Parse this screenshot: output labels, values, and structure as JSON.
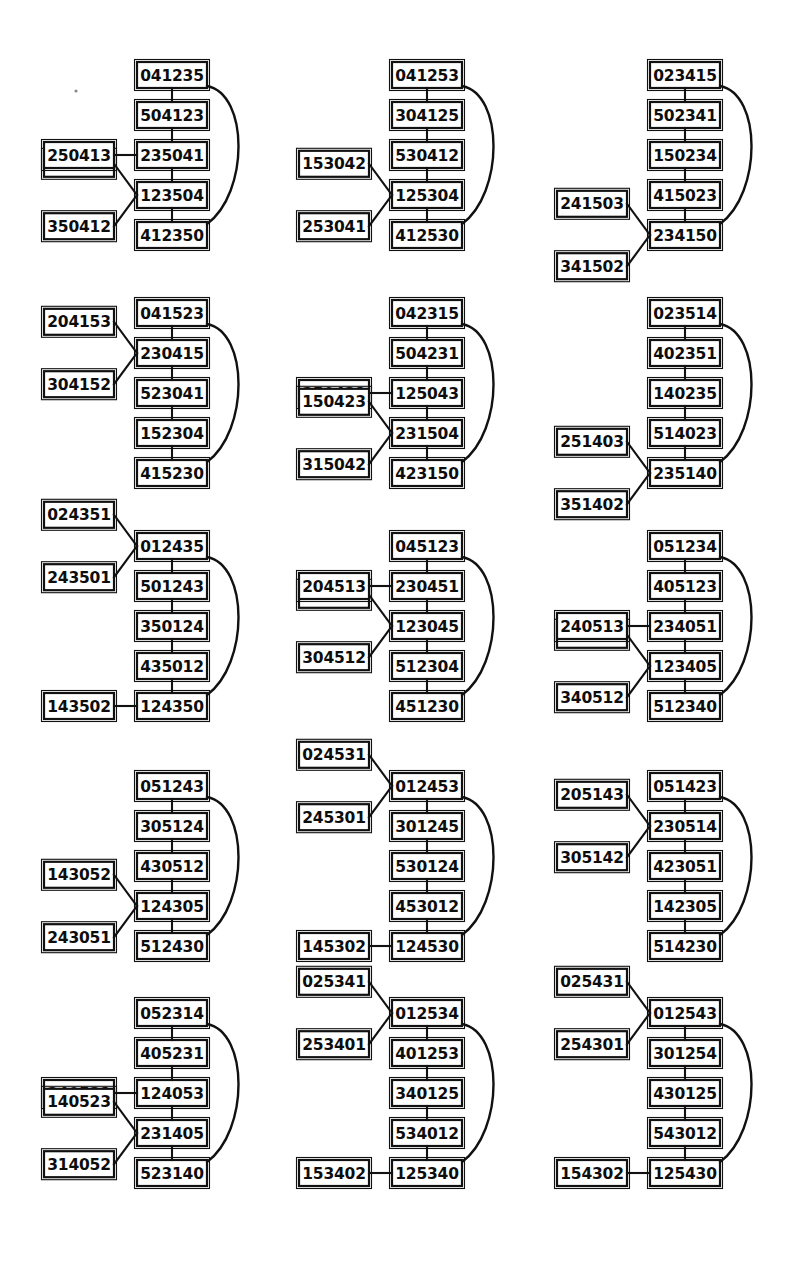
{
  "figure": {
    "type": "diagram-grid",
    "rows": 5,
    "columns": 3,
    "node_digit_count": 6,
    "colors": {
      "background": "#ffffff",
      "box_fill": "#ffffff",
      "stroke": "#111111",
      "text": "#0d0d0d"
    }
  },
  "diagrams": [
    {
      "id": "diagram-r1c1",
      "row": 1,
      "column": 1,
      "chain": [
        "041235",
        "504123",
        "235041",
        "123504",
        "412350"
      ],
      "arc": {
        "from": "041235",
        "to": "412350"
      },
      "side_nodes": [
        {
          "label": "250413",
          "attached_to": "235041"
        },
        {
          "label": "135042",
          "attached_to": "123504"
        },
        {
          "label": "350412",
          "attached_to": "123504"
        }
      ]
    },
    {
      "id": "diagram-r1c2",
      "row": 1,
      "column": 2,
      "chain": [
        "041253",
        "304125",
        "530412",
        "125304",
        "412530"
      ],
      "arc": {
        "from": "041253",
        "to": "412530"
      },
      "side_nodes": [
        {
          "label": "153042",
          "attached_to": "125304"
        },
        {
          "label": "253041",
          "attached_to": "125304"
        }
      ]
    },
    {
      "id": "diagram-r1c3",
      "row": 1,
      "column": 3,
      "chain": [
        "023415",
        "502341",
        "150234",
        "415023",
        "234150"
      ],
      "arc": {
        "from": "023415",
        "to": "234150"
      },
      "side_nodes": [
        {
          "label": "241503",
          "attached_to": "234150"
        },
        {
          "label": "341502",
          "attached_to": "234150"
        }
      ]
    },
    {
      "id": "diagram-r2c1",
      "row": 2,
      "column": 1,
      "chain": [
        "041523",
        "230415",
        "523041",
        "152304",
        "415230"
      ],
      "arc": {
        "from": "041523",
        "to": "415230"
      },
      "side_nodes": [
        {
          "label": "204153",
          "attached_to": "230415"
        },
        {
          "label": "304152",
          "attached_to": "230415"
        }
      ]
    },
    {
      "id": "diagram-r2c2",
      "row": 2,
      "column": 2,
      "chain": [
        "042315",
        "504231",
        "125043",
        "231504",
        "423150"
      ],
      "arc": {
        "from": "042315",
        "to": "423150"
      },
      "side_nodes": [
        {
          "label": "250431",
          "attached_to": "125043"
        },
        {
          "label": "150423",
          "attached_to": "231504"
        },
        {
          "label": "315042",
          "attached_to": "231504"
        }
      ]
    },
    {
      "id": "diagram-r2c3",
      "row": 2,
      "column": 3,
      "chain": [
        "023514",
        "402351",
        "140235",
        "514023",
        "235140"
      ],
      "arc": {
        "from": "023514",
        "to": "235140"
      },
      "side_nodes": [
        {
          "label": "251403",
          "attached_to": "235140"
        },
        {
          "label": "351402",
          "attached_to": "235140"
        }
      ]
    },
    {
      "id": "diagram-r3c1",
      "row": 3,
      "column": 1,
      "chain": [
        "012435",
        "501243",
        "350124",
        "435012",
        "124350"
      ],
      "arc": {
        "from": "012435",
        "to": "124350"
      },
      "side_nodes": [
        {
          "label": "024351",
          "attached_to": "012435"
        },
        {
          "label": "243501",
          "attached_to": "012435"
        },
        {
          "label": "143502",
          "attached_to": "124350"
        }
      ]
    },
    {
      "id": "diagram-r3c2",
      "row": 3,
      "column": 2,
      "chain": [
        "045123",
        "230451",
        "123045",
        "512304",
        "451230"
      ],
      "arc": {
        "from": "045123",
        "to": "451230"
      },
      "side_nodes": [
        {
          "label": "204513",
          "attached_to": "230451"
        },
        {
          "label": "130452",
          "attached_to": "123045"
        },
        {
          "label": "304512",
          "attached_to": "123045"
        }
      ]
    },
    {
      "id": "diagram-r3c3",
      "row": 3,
      "column": 3,
      "chain": [
        "051234",
        "405123",
        "234051",
        "123405",
        "512340"
      ],
      "arc": {
        "from": "051234",
        "to": "512340"
      },
      "side_nodes": [
        {
          "label": "240513",
          "attached_to": "234051"
        },
        {
          "label": "134052",
          "attached_to": "123405"
        },
        {
          "label": "340512",
          "attached_to": "123405"
        }
      ]
    },
    {
      "id": "diagram-r4c1",
      "row": 4,
      "column": 1,
      "chain": [
        "051243",
        "305124",
        "430512",
        "124305",
        "512430"
      ],
      "arc": {
        "from": "051243",
        "to": "512430"
      },
      "side_nodes": [
        {
          "label": "143052",
          "attached_to": "124305"
        },
        {
          "label": "243051",
          "attached_to": "124305"
        }
      ]
    },
    {
      "id": "diagram-r4c2",
      "row": 4,
      "column": 2,
      "chain": [
        "012453",
        "301245",
        "530124",
        "453012",
        "124530"
      ],
      "arc": {
        "from": "012453",
        "to": "124530"
      },
      "side_nodes": [
        {
          "label": "024531",
          "attached_to": "012453"
        },
        {
          "label": "245301",
          "attached_to": "012453"
        },
        {
          "label": "145302",
          "attached_to": "124530"
        }
      ]
    },
    {
      "id": "diagram-r4c3",
      "row": 4,
      "column": 3,
      "chain": [
        "051423",
        "230514",
        "423051",
        "142305",
        "514230"
      ],
      "arc": {
        "from": "051423",
        "to": "514230"
      },
      "side_nodes": [
        {
          "label": "205143",
          "attached_to": "230514"
        },
        {
          "label": "305142",
          "attached_to": "230514"
        }
      ]
    },
    {
      "id": "diagram-r5c1",
      "row": 5,
      "column": 1,
      "chain": [
        "052314",
        "405231",
        "124053",
        "231405",
        "523140"
      ],
      "arc": {
        "from": "052314",
        "to": "523140"
      },
      "side_nodes": [
        {
          "label": "240531",
          "attached_to": "124053"
        },
        {
          "label": "140523",
          "attached_to": "231405"
        },
        {
          "label": "314052",
          "attached_to": "231405"
        }
      ]
    },
    {
      "id": "diagram-r5c2",
      "row": 5,
      "column": 2,
      "chain": [
        "012534",
        "401253",
        "340125",
        "534012",
        "125340"
      ],
      "arc": {
        "from": "012534",
        "to": "125340"
      },
      "side_nodes": [
        {
          "label": "025341",
          "attached_to": "012534"
        },
        {
          "label": "253401",
          "attached_to": "012534"
        },
        {
          "label": "153402",
          "attached_to": "125340"
        }
      ]
    },
    {
      "id": "diagram-r5c3",
      "row": 5,
      "column": 3,
      "chain": [
        "012543",
        "301254",
        "430125",
        "543012",
        "125430"
      ],
      "arc": {
        "from": "012543",
        "to": "125430"
      },
      "side_nodes": [
        {
          "label": "025431",
          "attached_to": "012543"
        },
        {
          "label": "254301",
          "attached_to": "012543"
        },
        {
          "label": "154302",
          "attached_to": "125430"
        }
      ]
    }
  ],
  "layout": {
    "column_main_x": [
      137,
      392,
      650
    ],
    "column_side_x": [
      44,
      299,
      557
    ],
    "row_top_y": [
      62,
      300,
      533,
      773,
      1000
    ],
    "box_width": 70,
    "box_height": 26,
    "row_step": 40,
    "arc_bulge": 42
  }
}
